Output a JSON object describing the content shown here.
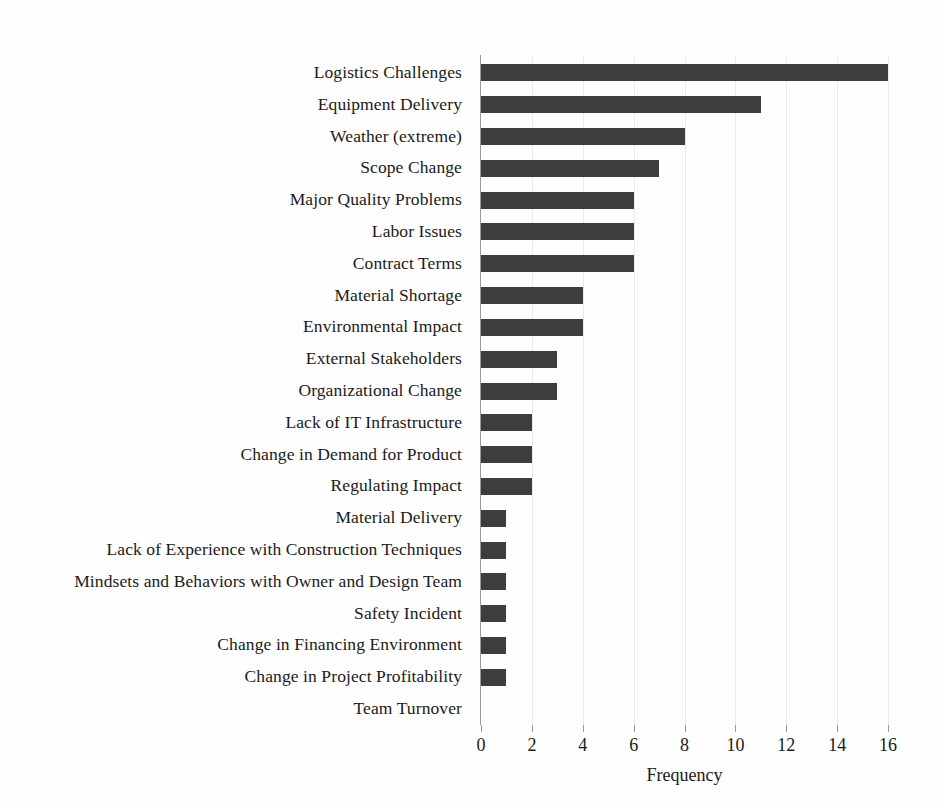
{
  "chart_data": {
    "type": "bar",
    "orientation": "horizontal",
    "title": "",
    "xlabel": "Frequency",
    "ylabel": "",
    "xlim": [
      0,
      16
    ],
    "xticks": [
      0,
      2,
      4,
      6,
      8,
      10,
      12,
      14,
      16
    ],
    "grid": true,
    "legend": null,
    "bar_color": "#3d3d3d",
    "gridline_color": "#e9e9e9",
    "axis_color": "#9a9a9a",
    "categories": [
      "Logistics Challenges",
      "Equipment Delivery",
      "Weather (extreme)",
      "Scope Change",
      "Major Quality Problems",
      "Labor Issues",
      "Contract Terms",
      "Material Shortage",
      "Environmental Impact",
      "External Stakeholders",
      "Organizational Change",
      "Lack of IT Infrastructure",
      "Change in Demand for Product",
      "Regulating Impact",
      "Material Delivery",
      "Lack of Experience with Construction Techniques",
      "Mindsets and Behaviors with Owner and Design Team",
      "Safety Incident",
      "Change in Financing Environment",
      "Change in Project Profitability",
      "Team Turnover"
    ],
    "values": [
      16,
      11,
      8,
      7,
      6,
      6,
      6,
      4,
      4,
      3,
      3,
      2,
      2,
      2,
      1,
      1,
      1,
      1,
      1,
      1,
      0
    ]
  }
}
